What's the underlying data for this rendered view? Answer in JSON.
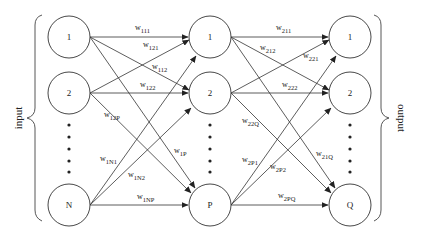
{
  "diagram": {
    "type": "neural-network",
    "side_labels": {
      "input": "input",
      "output": "output"
    },
    "layers": [
      {
        "name": "input",
        "nodes": [
          "1",
          "2",
          "N"
        ]
      },
      {
        "name": "hidden",
        "nodes": [
          "1",
          "2",
          "P"
        ]
      },
      {
        "name": "output",
        "nodes": [
          "1",
          "2",
          "Q"
        ]
      }
    ],
    "weights_layer1": [
      {
        "base": "w",
        "sub": "111"
      },
      {
        "base": "w",
        "sub": "121"
      },
      {
        "base": "w",
        "sub": "112"
      },
      {
        "base": "w",
        "sub": "122"
      },
      {
        "base": "w",
        "sub": "12P"
      },
      {
        "base": "w",
        "sub": "1N1"
      },
      {
        "base": "w",
        "sub": "1N2"
      },
      {
        "base": "w",
        "sub": "1P"
      },
      {
        "base": "w",
        "sub": "1NP"
      }
    ],
    "weights_layer2": [
      {
        "base": "w",
        "sub": "211"
      },
      {
        "base": "w",
        "sub": "212"
      },
      {
        "base": "w",
        "sub": "221"
      },
      {
        "base": "w",
        "sub": "222"
      },
      {
        "base": "w",
        "sub": "22Q"
      },
      {
        "base": "w",
        "sub": "2P1"
      },
      {
        "base": "w",
        "sub": "2P2"
      },
      {
        "base": "w",
        "sub": "21Q"
      },
      {
        "base": "w",
        "sub": "2PQ"
      }
    ],
    "ellipsis_dots": 5
  }
}
